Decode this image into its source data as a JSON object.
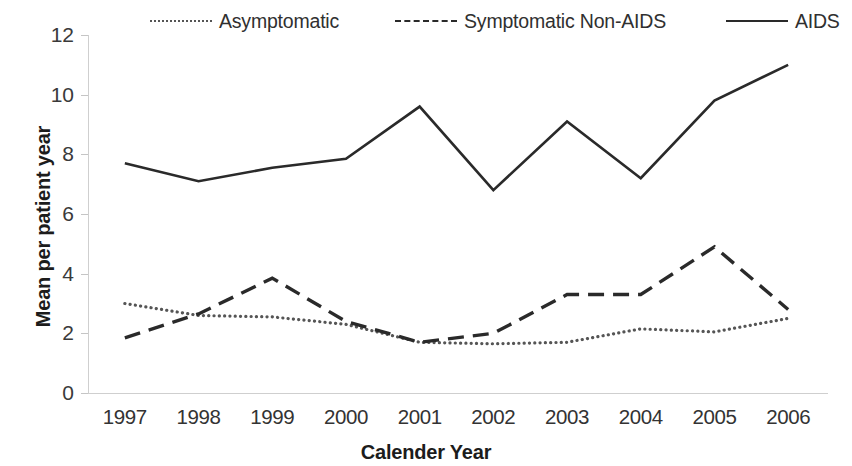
{
  "chart_data": {
    "type": "line",
    "title": "",
    "xlabel": "Calender Year",
    "ylabel": "Mean per patient year",
    "x": [
      1997,
      1998,
      1999,
      2000,
      2001,
      2002,
      2003,
      2004,
      2005,
      2006
    ],
    "categories": [
      "1997",
      "1998",
      "1999",
      "2000",
      "2001",
      "2002",
      "2003",
      "2004",
      "2005",
      "2006"
    ],
    "series": [
      {
        "name": "Asymptomatic",
        "style": "dotted",
        "color": "#555555",
        "values": [
          3.0,
          2.6,
          2.55,
          2.3,
          1.7,
          1.65,
          1.7,
          2.15,
          2.05,
          2.5
        ]
      },
      {
        "name": "Symptomatic Non-AIDS",
        "style": "dashed",
        "color": "#2a2a2a",
        "values": [
          1.85,
          2.65,
          3.85,
          2.4,
          1.7,
          2.0,
          3.3,
          3.3,
          4.9,
          2.8
        ]
      },
      {
        "name": "AIDS",
        "style": "solid",
        "color": "#2a2a2a",
        "values": [
          7.7,
          7.1,
          7.55,
          7.85,
          9.6,
          6.8,
          9.1,
          7.2,
          9.8,
          11.0
        ]
      }
    ],
    "ylim": [
      0,
      12
    ],
    "y_ticks": [
      0,
      2,
      4,
      6,
      8,
      10,
      12
    ],
    "y_tick_labels": [
      "0",
      "2",
      "4",
      "6",
      "8",
      "10",
      "12"
    ],
    "grid": false,
    "legend_position": "top"
  },
  "legend": {
    "items": [
      {
        "label": "Asymptomatic",
        "style": "dotted"
      },
      {
        "label": "Symptomatic Non-AIDS",
        "style": "dashed"
      },
      {
        "label": "AIDS",
        "style": "solid"
      }
    ]
  },
  "axes": {
    "y_title": "Mean per patient year",
    "x_title": "Calender Year"
  }
}
